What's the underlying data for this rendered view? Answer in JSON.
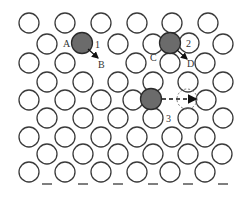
{
  "diagram": {
    "type": "crystal-lattice-point-defects",
    "colors": {
      "atom_outline": "#3a3a3a",
      "filled_atom": "#6b6b6b",
      "background": "#ffffff"
    },
    "atom_radius": 10,
    "atoms": [
      {
        "x": 29,
        "y": 23
      },
      {
        "x": 65,
        "y": 23
      },
      {
        "x": 101,
        "y": 23
      },
      {
        "x": 137,
        "y": 23
      },
      {
        "x": 172,
        "y": 23
      },
      {
        "x": 208,
        "y": 23
      },
      {
        "x": 47,
        "y": 44
      },
      {
        "x": 118,
        "y": 44
      },
      {
        "x": 153,
        "y": 44
      },
      {
        "x": 223,
        "y": 44
      },
      {
        "x": 29,
        "y": 63
      },
      {
        "x": 65,
        "y": 63
      },
      {
        "x": 136,
        "y": 63
      },
      {
        "x": 170,
        "y": 63
      },
      {
        "x": 205,
        "y": 63
      },
      {
        "x": 47,
        "y": 82
      },
      {
        "x": 83,
        "y": 82
      },
      {
        "x": 118,
        "y": 82
      },
      {
        "x": 153,
        "y": 82
      },
      {
        "x": 188,
        "y": 82
      },
      {
        "x": 223,
        "y": 82
      },
      {
        "x": 29,
        "y": 100
      },
      {
        "x": 65,
        "y": 100
      },
      {
        "x": 101,
        "y": 100
      },
      {
        "x": 133,
        "y": 100
      },
      {
        "x": 206,
        "y": 100
      },
      {
        "x": 47,
        "y": 118
      },
      {
        "x": 83,
        "y": 118
      },
      {
        "x": 118,
        "y": 118
      },
      {
        "x": 153,
        "y": 118
      },
      {
        "x": 188,
        "y": 118
      },
      {
        "x": 223,
        "y": 118
      },
      {
        "x": 29,
        "y": 137
      },
      {
        "x": 65,
        "y": 137
      },
      {
        "x": 101,
        "y": 137
      },
      {
        "x": 137,
        "y": 137
      },
      {
        "x": 172,
        "y": 137
      },
      {
        "x": 205,
        "y": 137
      },
      {
        "x": 47,
        "y": 154
      },
      {
        "x": 83,
        "y": 154
      },
      {
        "x": 118,
        "y": 154
      },
      {
        "x": 153,
        "y": 154
      },
      {
        "x": 188,
        "y": 154
      },
      {
        "x": 222,
        "y": 154
      },
      {
        "x": 29,
        "y": 172
      },
      {
        "x": 65,
        "y": 172
      },
      {
        "x": 101,
        "y": 172
      },
      {
        "x": 137,
        "y": 172
      },
      {
        "x": 170,
        "y": 172
      },
      {
        "x": 205,
        "y": 172
      }
    ],
    "highlighted_atoms": [
      {
        "id": "A",
        "x": 82,
        "y": 43
      },
      {
        "id": "C-site",
        "x": 170,
        "y": 43
      },
      {
        "id": "3-site",
        "x": 151,
        "y": 99
      }
    ],
    "numbered_atom": {
      "x": 189,
      "y": 43,
      "label": "2"
    },
    "vacancy_dashed": {
      "x": 187,
      "y": 99
    },
    "labels": {
      "A": "A",
      "B": "B",
      "C": "C",
      "D": "D",
      "n1": "1",
      "n2": "2",
      "n3": "3"
    },
    "arrows": [
      {
        "name": "arrow-1-to-B",
        "x1": 88,
        "y1": 49,
        "x2": 98,
        "y2": 58,
        "style": "solid"
      },
      {
        "name": "arrow-2-to-D",
        "x1": 177,
        "y1": 50,
        "x2": 187,
        "y2": 59,
        "style": "solid"
      },
      {
        "name": "arrow-3-right",
        "x1": 162,
        "y1": 99,
        "x2": 196,
        "y2": 99,
        "style": "dashed"
      }
    ]
  }
}
